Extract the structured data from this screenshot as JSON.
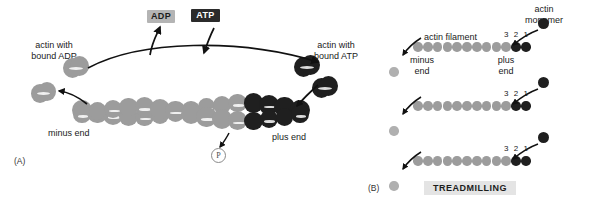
{
  "figure": {
    "width": 595,
    "height": 208,
    "background": "#ffffff",
    "colors": {
      "adp_actin": "#9c9c9c",
      "atp_actin": "#1f1f1f",
      "free_monomer_pale": "#b0b0b0",
      "adp_box_bg": "#b4b4b4",
      "adp_box_text": "#1c1c1c",
      "atp_box_bg": "#2b2b2b",
      "atp_box_text": "#ffffff",
      "treadmilling_box_bg": "#e4e4e4",
      "text": "#1a1a1a"
    }
  },
  "panel_a": {
    "tag": "(A)",
    "nucleotide_boxes": [
      {
        "label": "ADP",
        "style": "light"
      },
      {
        "label": "ATP",
        "style": "dark"
      }
    ],
    "labels": {
      "actin_with_bound_adp": "actin with\nbound ADP",
      "actin_with_bound_atp": "actin with\nbound ATP",
      "minus_end": "minus end",
      "plus_end": "plus end",
      "phosphate": "P"
    }
  },
  "panel_b": {
    "tag": "(B)",
    "title_box": "TREADMILLING",
    "labels": {
      "actin_monomer": "actin\nmonomer",
      "actin_filament": "actin filament",
      "minus_end": "minus\nend",
      "plus_end": "plus\nend"
    },
    "subunit_numbers": [
      "3",
      "2",
      "1"
    ],
    "rows": [
      {
        "light_count": 10,
        "dark_count": 2,
        "has_incoming_monomer": true,
        "has_released_monomer": true
      },
      {
        "light_count": 10,
        "dark_count": 2,
        "has_incoming_monomer": true,
        "has_released_monomer": true
      },
      {
        "light_count": 10,
        "dark_count": 2,
        "has_incoming_monomer": true,
        "has_released_monomer": true
      }
    ]
  }
}
